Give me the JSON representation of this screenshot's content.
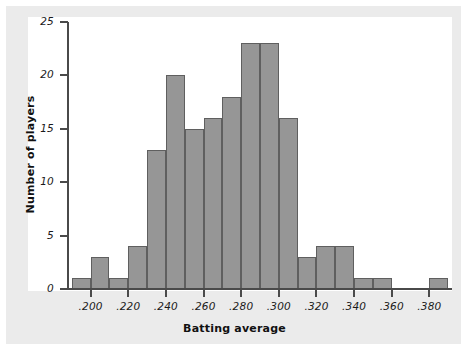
{
  "chart_data": {
    "type": "bar",
    "title": "",
    "subtitle": "",
    "xlabel": "Batting average",
    "ylabel": "Number of players",
    "xtick_labels": [
      ".200",
      ".220",
      ".240",
      ".260",
      ".280",
      ".300",
      ".320",
      ".340",
      ".360",
      ".380"
    ],
    "xtick_values": [
      0.2,
      0.22,
      0.24,
      0.26,
      0.28,
      0.3,
      0.32,
      0.34,
      0.36,
      0.38
    ],
    "ytick_labels": [
      "0",
      "5",
      "10",
      "15",
      "20",
      "25"
    ],
    "ytick_values": [
      0,
      5,
      10,
      15,
      20,
      25
    ],
    "xlim": [
      0.188,
      0.392
    ],
    "ylim": [
      0,
      25
    ],
    "bin_width": 0.01,
    "grid": false,
    "legend": false,
    "bar_color": "#969696",
    "bar_edge_color": "#5f5f5f",
    "axis_color": "#4a4a4a",
    "plot_background": "#ffffff",
    "figure_background": "#ebebeb",
    "bins": [
      {
        "x0": 0.19,
        "x1": 0.2,
        "value": 1
      },
      {
        "x0": 0.2,
        "x1": 0.21,
        "value": 3
      },
      {
        "x0": 0.21,
        "x1": 0.22,
        "value": 1
      },
      {
        "x0": 0.22,
        "x1": 0.23,
        "value": 4
      },
      {
        "x0": 0.23,
        "x1": 0.24,
        "value": 13
      },
      {
        "x0": 0.24,
        "x1": 0.25,
        "value": 20
      },
      {
        "x0": 0.25,
        "x1": 0.26,
        "value": 15
      },
      {
        "x0": 0.26,
        "x1": 0.27,
        "value": 16
      },
      {
        "x0": 0.27,
        "x1": 0.28,
        "value": 18
      },
      {
        "x0": 0.28,
        "x1": 0.29,
        "value": 23
      },
      {
        "x0": 0.29,
        "x1": 0.3,
        "value": 23
      },
      {
        "x0": 0.3,
        "x1": 0.31,
        "value": 16
      },
      {
        "x0": 0.31,
        "x1": 0.32,
        "value": 3
      },
      {
        "x0": 0.32,
        "x1": 0.33,
        "value": 4
      },
      {
        "x0": 0.33,
        "x1": 0.34,
        "value": 4
      },
      {
        "x0": 0.34,
        "x1": 0.35,
        "value": 1
      },
      {
        "x0": 0.35,
        "x1": 0.36,
        "value": 1
      },
      {
        "x0": 0.36,
        "x1": 0.37,
        "value": 0
      },
      {
        "x0": 0.37,
        "x1": 0.38,
        "value": 0
      },
      {
        "x0": 0.38,
        "x1": 0.39,
        "value": 1
      }
    ],
    "categories": [
      "0.190-0.200",
      "0.200-0.210",
      "0.210-0.220",
      "0.220-0.230",
      "0.230-0.240",
      "0.240-0.250",
      "0.250-0.260",
      "0.260-0.270",
      "0.270-0.280",
      "0.280-0.290",
      "0.290-0.300",
      "0.300-0.310",
      "0.310-0.320",
      "0.320-0.330",
      "0.330-0.340",
      "0.340-0.350",
      "0.350-0.360",
      "0.360-0.370",
      "0.370-0.380",
      "0.380-0.390"
    ],
    "values": [
      1,
      3,
      1,
      4,
      13,
      20,
      15,
      16,
      18,
      23,
      23,
      16,
      3,
      4,
      4,
      1,
      1,
      0,
      0,
      1
    ]
  }
}
